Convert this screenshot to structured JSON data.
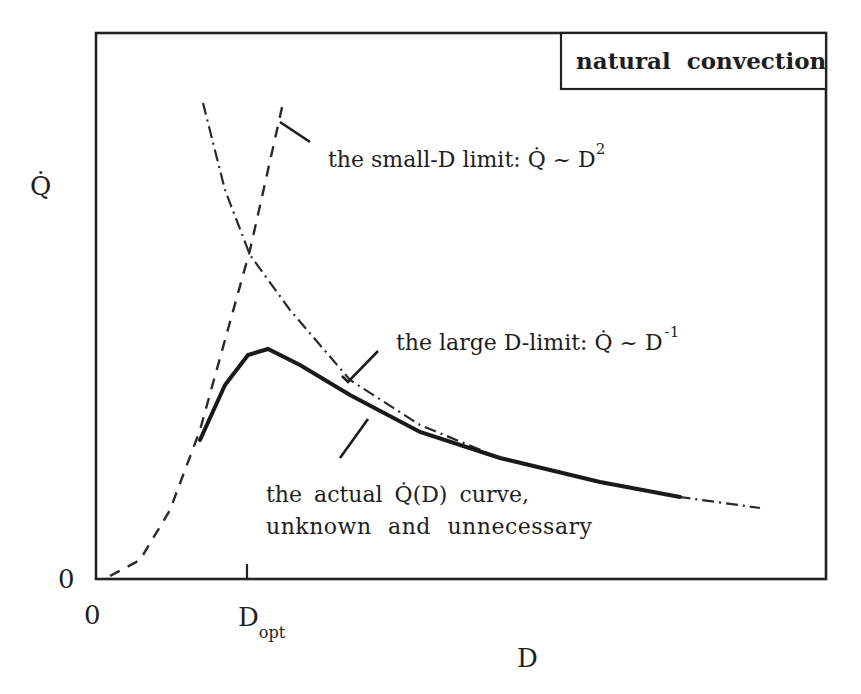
{
  "chart_data": {
    "type": "line",
    "title": "",
    "legend": {
      "label": "natural convection",
      "position": "top-right"
    },
    "xlabel": "D",
    "ylabel": "Q̇",
    "x_ticks": [
      {
        "label": "0",
        "value": 0
      },
      {
        "label": "D",
        "subscript": "opt",
        "value": "D_opt"
      }
    ],
    "y_ticks": [
      {
        "label": "0",
        "value": 0
      }
    ],
    "grid": false,
    "axes_units": "qualitative (no numeric scale)",
    "series": [
      {
        "name": "small-D limit",
        "style": "dashed",
        "relation": "Q̇ ~ D^2",
        "points_px": [
          [
            110,
            576
          ],
          [
            140,
            560
          ],
          [
            170,
            510
          ],
          [
            200,
            430
          ],
          [
            225,
            340
          ],
          [
            250,
            250
          ],
          [
            268,
            170
          ],
          [
            283,
            103
          ]
        ]
      },
      {
        "name": "large-D limit",
        "style": "dash-dot",
        "relation": "Q̇ ~ D^-1",
        "points_px": [
          [
            203,
            103
          ],
          [
            225,
            190
          ],
          [
            250,
            255
          ],
          [
            290,
            310
          ],
          [
            350,
            380
          ],
          [
            420,
            425
          ],
          [
            500,
            458
          ],
          [
            600,
            482
          ],
          [
            680,
            497
          ],
          [
            760,
            508
          ]
        ]
      },
      {
        "name": "actual Q̇(D) curve",
        "style": "solid",
        "points_px": [
          [
            200,
            440
          ],
          [
            225,
            385
          ],
          [
            248,
            355
          ],
          [
            268,
            349
          ],
          [
            300,
            365
          ],
          [
            350,
            395
          ],
          [
            420,
            432
          ],
          [
            500,
            458
          ],
          [
            600,
            482
          ],
          [
            680,
            497
          ]
        ]
      }
    ],
    "annotations": [
      {
        "text": "the small-D limit: Q̇ ~ D",
        "superscript": "2",
        "points_to": "small-D limit"
      },
      {
        "text": "the large D-limit: Q̇ ~ D",
        "superscript": "-1",
        "points_to": "large-D limit"
      },
      {
        "text": "the actual Q̇(D) curve,",
        "text2": "unknown and unnecessary",
        "points_to": "actual Q̇(D) curve"
      }
    ]
  },
  "labels": {
    "legend": "natural convection",
    "y_axis": "Q̇",
    "y_axis_Q": "Q",
    "x_axis": "D",
    "y_zero": "0",
    "x_zero": "0",
    "dopt_main": "D",
    "dopt_sub": "opt",
    "small_text": "the small-D limit: Q̇ ~ D",
    "small_sup": "2",
    "large_text": "the large D-limit: Q̇ ~ D",
    "large_sup": "-1",
    "actual_line1": "the actual Q̇(D) curve,",
    "actual_line2": "unknown and unnecessary"
  }
}
